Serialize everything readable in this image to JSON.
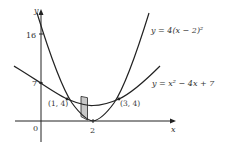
{
  "axes": {
    "x_label": "x",
    "y_label": "y",
    "origin_label": "0",
    "y_ticks": [
      "16",
      "7"
    ],
    "x_ticks": [
      "2"
    ]
  },
  "curves": [
    {
      "name": "steep-parabola",
      "label": "y = 4(x − 2)²"
    },
    {
      "name": "wide-parabola",
      "label": "y = x² − 4x + 7"
    }
  ],
  "points": [
    {
      "label": "(1, 4)"
    },
    {
      "label": "(3, 4)"
    }
  ],
  "colors": {
    "stroke": "#222222",
    "shade": "#c8c8c8",
    "text": "#333333"
  }
}
